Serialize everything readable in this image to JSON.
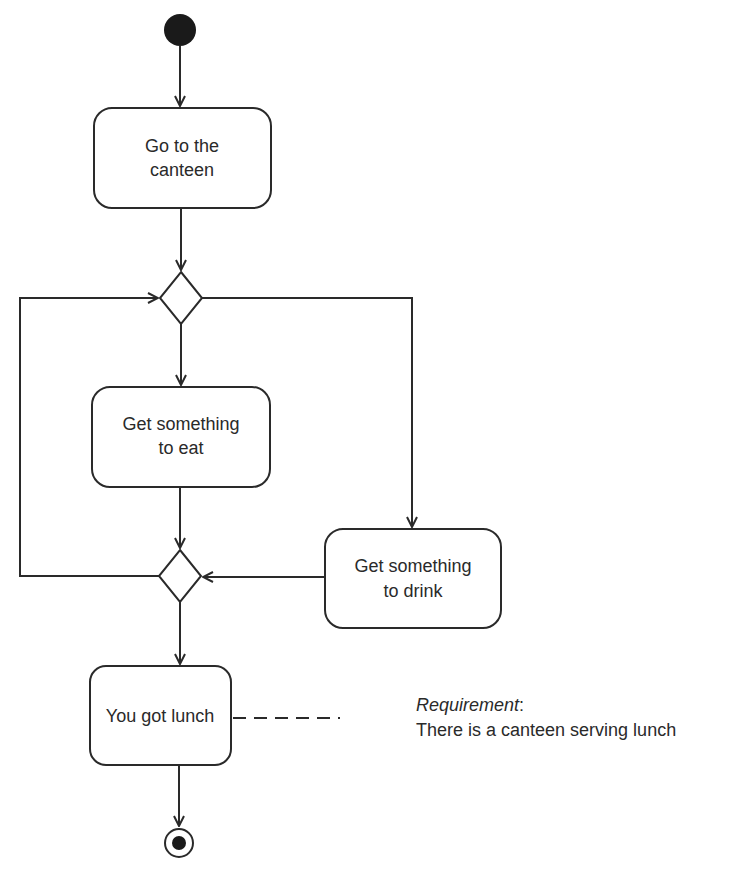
{
  "diagram": {
    "type": "UML activity diagram",
    "start_node": {
      "kind": "initial"
    },
    "end_node": {
      "kind": "final"
    },
    "activities": [
      {
        "id": "go",
        "line1": "Go to the",
        "line2": "canteen"
      },
      {
        "id": "eat",
        "line1": "Get something",
        "line2": "to eat"
      },
      {
        "id": "drink",
        "line1": "Get something",
        "line2": "to drink"
      },
      {
        "id": "lunch",
        "line1": "You got lunch"
      }
    ],
    "decisions": [
      {
        "id": "decision-top"
      },
      {
        "id": "merge-bottom"
      }
    ],
    "note": {
      "title": "Requirement",
      "title_suffix": ":",
      "text": "There is a canteen serving lunch"
    },
    "colors": {
      "stroke": "#2a2a2a",
      "background": "#ffffff"
    }
  }
}
